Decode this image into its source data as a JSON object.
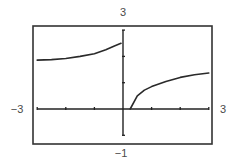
{
  "chart_data": {
    "type": "line",
    "title": "",
    "xlabel": "",
    "ylabel": "",
    "xlim": [
      -3,
      3
    ],
    "ylim": [
      -1,
      3
    ],
    "grid": false,
    "legend": null,
    "window_labels": {
      "xmin": "−3",
      "xmax": "3",
      "ymin": "−1",
      "ymax": "3"
    },
    "x_ticks": [
      -3,
      -2,
      -1,
      0,
      1,
      2,
      3
    ],
    "y_ticks": [
      -1,
      0,
      1,
      2,
      3
    ],
    "series": [
      {
        "name": "left branch",
        "x": [
          -3.0,
          -2.5,
          -2.0,
          -1.5,
          -1.0,
          -0.6,
          -0.3,
          -0.07
        ],
        "y": [
          1.86,
          1.88,
          1.92,
          2.0,
          2.1,
          2.25,
          2.4,
          2.5
        ]
      },
      {
        "name": "right branch",
        "x": [
          0.25,
          0.5,
          0.75,
          1.0,
          1.5,
          2.0,
          2.5,
          3.0
        ],
        "y": [
          0.0,
          0.5,
          0.72,
          0.85,
          1.05,
          1.2,
          1.3,
          1.37
        ]
      }
    ],
    "colors": {
      "frame": "#333333",
      "axes": "#222222",
      "curve": "#2a2a2a",
      "labels": "#4a4a4a"
    }
  }
}
